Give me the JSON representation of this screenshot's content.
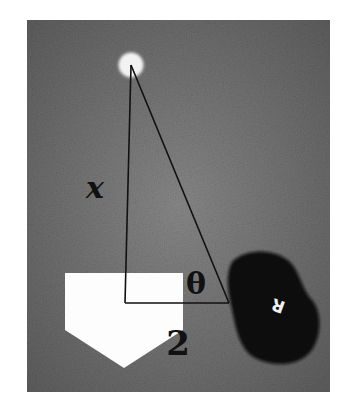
{
  "figure": {
    "labels": {
      "vertical_side": "x",
      "angle": "θ",
      "horizontal_side": "2"
    },
    "cap_letter": "R",
    "colors": {
      "field": "#7a7a7a",
      "plate": "#ffffff",
      "cap": "#0d0d0d",
      "ball": "#f2f2f2",
      "lines": "#111111"
    }
  }
}
